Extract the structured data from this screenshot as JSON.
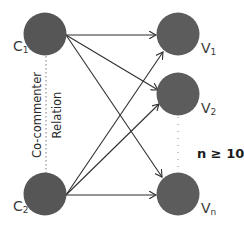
{
  "diagram": {
    "colors": {
      "node_fill": "#565656",
      "edge": "#2f2f2f",
      "dotted": "#7a7a7a",
      "background": "#ffffff"
    },
    "commenters": [
      {
        "id": "C1",
        "base": "C",
        "sub": "1"
      },
      {
        "id": "C2",
        "base": "C",
        "sub": "2"
      }
    ],
    "videos": [
      {
        "id": "V1",
        "base": "V",
        "sub": "1"
      },
      {
        "id": "V2",
        "base": "V",
        "sub": "2"
      },
      {
        "id": "Vn",
        "base": "V",
        "sub": "n"
      }
    ],
    "relation": {
      "line1": "Co-commenter",
      "line2": "Relation"
    },
    "constraint": "n ≥ 10",
    "edges": [
      {
        "from": "C1",
        "to": "V1"
      },
      {
        "from": "C1",
        "to": "V2"
      },
      {
        "from": "C1",
        "to": "Vn"
      },
      {
        "from": "C2",
        "to": "V1"
      },
      {
        "from": "C2",
        "to": "V2"
      },
      {
        "from": "C2",
        "to": "Vn"
      }
    ]
  }
}
